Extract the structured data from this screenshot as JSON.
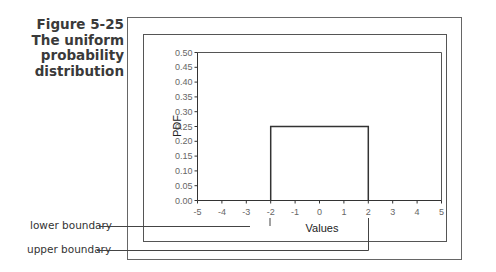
{
  "caption": {
    "figure_number": "Figure 5-25",
    "title_lines": [
      "The uniform",
      "probability",
      "distribution"
    ]
  },
  "callouts": {
    "lower": "lower boundary",
    "upper": "upper boundary"
  },
  "colors": {
    "frame": "#555555",
    "axis": "#333333",
    "series": "#333333",
    "tick_text": "#666666"
  },
  "chart_data": {
    "type": "line",
    "title": "",
    "xlabel": "Values",
    "ylabel": "PDF",
    "xlim": [
      -5,
      5
    ],
    "ylim": [
      0,
      0.5
    ],
    "x_ticks": [
      "-5",
      "-4",
      "-3",
      "-2",
      "-1",
      "0",
      "1",
      "2",
      "3",
      "4",
      "5"
    ],
    "y_ticks": [
      "0.00",
      "0.05",
      "0.10",
      "0.15",
      "0.20",
      "0.25",
      "0.30",
      "0.35",
      "0.40",
      "0.45",
      "0.50"
    ],
    "grid": false,
    "legend": null,
    "series": [
      {
        "name": "uniform PDF",
        "x": [
          -2,
          -2,
          2,
          2
        ],
        "y": [
          0,
          0.25,
          0.25,
          0
        ]
      }
    ],
    "annotations": [
      {
        "text": "lower boundary",
        "x": -2
      },
      {
        "text": "upper boundary",
        "x": 2
      }
    ]
  }
}
